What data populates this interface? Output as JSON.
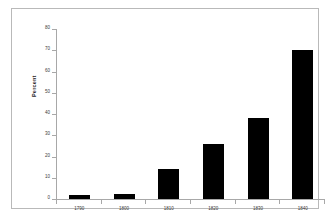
{
  "chart_data": {
    "type": "bar",
    "title": "",
    "xlabel": "",
    "ylabel": "Percent",
    "categories": [
      "1790",
      "1800",
      "1810",
      "1820",
      "1830",
      "1840"
    ],
    "values": [
      2,
      2.5,
      14,
      26,
      38,
      70
    ],
    "ylim": [
      0,
      80
    ],
    "ytick_step": 10,
    "yticks": [
      "80",
      "70",
      "60",
      "50",
      "40",
      "30",
      "20",
      "10",
      "0"
    ],
    "grid": false,
    "legend": null,
    "bar_color": "#000000",
    "axis_color": "#a8a8a8",
    "frame_color": "#b9b9b9",
    "background": "#ffffff"
  }
}
